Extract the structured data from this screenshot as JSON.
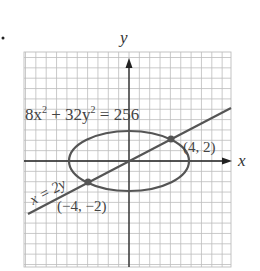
{
  "chart_data": {
    "type": "line",
    "title": "",
    "xlabel": "x",
    "ylabel": "y",
    "grid": true,
    "xlim": [
      -10,
      10
    ],
    "ylim": [
      -10,
      10
    ],
    "series": [
      {
        "name": "8x^2 + 32y^2 = 256",
        "kind": "ellipse",
        "center": [
          0,
          0
        ],
        "semi_major_x": 5.657,
        "semi_minor_y": 2.828
      },
      {
        "name": "x = 2y",
        "kind": "line",
        "slope": 0.5,
        "intercept": 0
      }
    ],
    "points": [
      {
        "label": "(4, 2)",
        "x": 4,
        "y": 2
      },
      {
        "label": "(−4, −2)",
        "x": -4,
        "y": -2
      }
    ],
    "annotations": {
      "ellipse_label": "8x² + 32y² = 256",
      "line_label": "x = 2y",
      "point1_label": "(4, 2)",
      "point2_label": "(−4, −2)"
    }
  },
  "labels": {
    "x_axis": "x",
    "y_axis": "y",
    "eq_main": "8x",
    "eq_sup1": "2",
    "eq_mid": " + 32y",
    "eq_sup2": "2",
    "eq_end": " = 256",
    "line_eq": "x = 2y",
    "p1": "(4, 2)",
    "p2": "(−4, −2)"
  },
  "colors": {
    "axis": "#222222",
    "curve": "#555555",
    "grid_major": "#bdbdbd",
    "grid_minor": "#dcdcdc",
    "text": "#444444"
  }
}
